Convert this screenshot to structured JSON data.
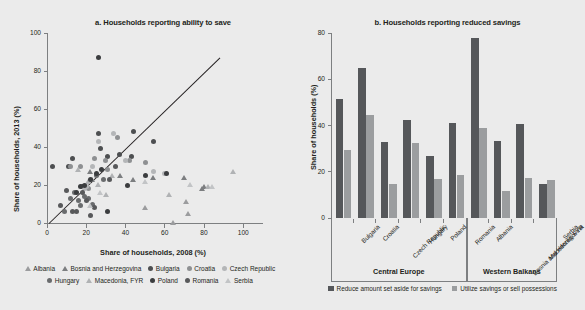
{
  "figure": {
    "background": "#ebebeb"
  },
  "panel_a": {
    "title": "a. Households reporting ability to save",
    "ylabel": "Share of households, 2013 (%)",
    "xlabel": "Share of households, 2008 (%)",
    "yticks": [
      "0",
      "20",
      "40",
      "60",
      "80",
      "100"
    ],
    "xticks": [
      "0",
      "20",
      "40",
      "60",
      "80",
      "100"
    ],
    "legend": [
      {
        "label": "Albania",
        "marker": "triangle",
        "color": "#9b9c9e"
      },
      {
        "label": "Bosnia and Herzegovina",
        "marker": "triangle",
        "color": "#7c7e80"
      },
      {
        "label": "Bulgaria",
        "marker": "circle",
        "color": "#4d4f51"
      },
      {
        "label": "Croatia",
        "marker": "circle",
        "color": "#8e9092"
      },
      {
        "label": "Czech Republic",
        "marker": "circle",
        "color": "#b4b6b8"
      },
      {
        "label": "Hungary",
        "marker": "circle",
        "color": "#6a6c6e"
      },
      {
        "label": "Macedonia, FYR",
        "marker": "triangle",
        "color": "#b0b2b4"
      },
      {
        "label": "Poland",
        "marker": "circle",
        "color": "#3b3d3f"
      },
      {
        "label": "Romania",
        "marker": "circle",
        "color": "#58595b"
      },
      {
        "label": "Serbia",
        "marker": "triangle",
        "color": "#c2c4c6"
      }
    ]
  },
  "panel_b": {
    "title": "b. Households reporting reduced savings",
    "ylabel": "Share of households (%)",
    "yticks": [
      "0",
      "20",
      "40",
      "60",
      "80"
    ],
    "groups": [
      {
        "label": "Central Europe",
        "span": 6
      },
      {
        "label": "Western Balkans",
        "span": 4
      }
    ],
    "legend": [
      {
        "label": "Reduce amount set aside for savings",
        "color": "#55575a"
      },
      {
        "label": "Utilize savings or sell possessions",
        "color": "#9b9d9f"
      }
    ]
  },
  "chart_data": [
    {
      "type": "scatter",
      "title": "a. Households reporting ability to save",
      "xlabel": "Share of households, 2008 (%)",
      "ylabel": "Share of households, 2013 (%)",
      "xlim": [
        0,
        108
      ],
      "ylim": [
        0,
        100
      ],
      "xticks": [
        0,
        20,
        40,
        60,
        80,
        100
      ],
      "yticks": [
        0,
        20,
        40,
        60,
        80,
        100
      ],
      "grid": false,
      "legend_position": "bottom",
      "reference_line": {
        "type": "45-degree",
        "from": [
          1,
          0
        ],
        "to": [
          88,
          87
        ]
      },
      "series": [
        {
          "name": "Albania",
          "marker": "triangle",
          "color": "#9b9c9e",
          "points": [
            [
              50,
              8
            ],
            [
              64,
              0
            ],
            [
              72,
              5
            ],
            [
              71,
              11
            ]
          ]
        },
        {
          "name": "Bosnia and Herzegovina",
          "marker": "triangle",
          "color": "#7c7e80",
          "points": [
            [
              22,
              27
            ],
            [
              23,
              23
            ],
            [
              37,
              25
            ],
            [
              44,
              23
            ],
            [
              54,
              24
            ],
            [
              70,
              24
            ],
            [
              79,
              18
            ],
            [
              80,
              19
            ]
          ]
        },
        {
          "name": "Bulgaria",
          "marker": "circle",
          "color": "#4d4f51",
          "points": [
            [
              3,
              30
            ],
            [
              11,
              30
            ],
            [
              13,
              34
            ],
            [
              18,
              19
            ],
            [
              26,
              47
            ],
            [
              27,
              39
            ],
            [
              31,
              35
            ],
            [
              37,
              36
            ],
            [
              43,
              35
            ],
            [
              54,
              43
            ],
            [
              44,
              48
            ]
          ]
        },
        {
          "name": "Croatia",
          "marker": "circle",
          "color": "#8e9092",
          "points": [
            [
              12,
              30
            ],
            [
              17,
              30
            ],
            [
              21,
              18
            ],
            [
              24,
              34
            ],
            [
              30,
              33
            ],
            [
              36,
              45
            ],
            [
              42,
              33
            ],
            [
              50,
              32
            ],
            [
              31,
              28
            ]
          ]
        },
        {
          "name": "Czech Republic",
          "marker": "circle",
          "color": "#b4b6b8",
          "points": [
            [
              19,
              18
            ],
            [
              20,
              19
            ],
            [
              23,
              30
            ],
            [
              26,
              43
            ],
            [
              34,
              47
            ],
            [
              40,
              33
            ],
            [
              54,
              27
            ],
            [
              60,
              26
            ]
          ]
        },
        {
          "name": "Hungary",
          "marker": "circle",
          "color": "#6a6c6e",
          "points": [
            [
              9,
              6
            ],
            [
              12,
              13
            ],
            [
              14,
              16
            ],
            [
              16,
              12
            ],
            [
              17,
              9
            ],
            [
              19,
              14
            ],
            [
              21,
              13
            ],
            [
              23,
              10
            ],
            [
              25,
              25
            ],
            [
              29,
              23
            ]
          ]
        },
        {
          "name": "Macedonia, FYR",
          "marker": "triangle",
          "color": "#b0b2b4",
          "points": [
            [
              16,
              28
            ],
            [
              21,
              22
            ],
            [
              26,
              20
            ],
            [
              30,
              15
            ],
            [
              33,
              25
            ],
            [
              62,
              15
            ],
            [
              82,
              19
            ],
            [
              95,
              27
            ]
          ]
        },
        {
          "name": "Poland",
          "marker": "circle",
          "color": "#3b3d3f",
          "points": [
            [
              15,
              16
            ],
            [
              17,
              19
            ],
            [
              19,
              20
            ],
            [
              22,
              23
            ],
            [
              25,
              26
            ],
            [
              28,
              28
            ],
            [
              31,
              6
            ],
            [
              41,
              20
            ],
            [
              50,
              25
            ],
            [
              61,
              26
            ],
            [
              26,
              87
            ]
          ]
        },
        {
          "name": "Romania",
          "marker": "circle",
          "color": "#58595b",
          "points": [
            [
              7,
              9
            ],
            [
              10,
              17
            ],
            [
              13,
              6
            ],
            [
              15,
              6
            ],
            [
              18,
              16
            ],
            [
              20,
              12
            ],
            [
              22,
              4
            ],
            [
              24,
              8
            ],
            [
              32,
              23
            ],
            [
              35,
              30
            ]
          ]
        },
        {
          "name": "Serbia",
          "marker": "triangle",
          "color": "#c2c4c6",
          "points": [
            [
              22,
              9
            ],
            [
              27,
              16
            ],
            [
              50,
              22
            ],
            [
              73,
              20
            ],
            [
              84,
              19
            ]
          ]
        }
      ]
    },
    {
      "type": "bar",
      "title": "b. Households reporting reduced savings",
      "xlabel": "",
      "ylabel": "Share of households (%)",
      "ylim": [
        0,
        80
      ],
      "yticks": [
        0,
        20,
        40,
        60,
        80
      ],
      "grid": false,
      "legend_position": "bottom",
      "categories": [
        "Bulgaria",
        "Croatia",
        "Czech Republic",
        "Hungary",
        "Poland",
        "Romania",
        "Albania",
        "Bosnia and Herzegovina",
        "Macedonia, FYR",
        "Serbia"
      ],
      "groups": [
        {
          "label": "Central Europe",
          "categories": [
            "Bulgaria",
            "Croatia",
            "Czech Republic",
            "Hungary",
            "Poland",
            "Romania"
          ]
        },
        {
          "label": "Western Balkans",
          "categories": [
            "Albania",
            "Bosnia and Herzegovina",
            "Macedonia, FYR",
            "Serbia"
          ]
        }
      ],
      "series": [
        {
          "name": "Reduce amount set aside for savings",
          "color": "#55575a",
          "values": [
            51.5,
            65,
            33,
            42.5,
            27,
            41,
            78,
            33.5,
            40.5,
            14.5
          ]
        },
        {
          "name": "Utilize savings or sell possessions",
          "color": "#9b9d9f",
          "values": [
            29.5,
            44.5,
            14.5,
            32.5,
            17,
            18.5,
            39,
            11.5,
            17.5,
            16.5
          ]
        }
      ]
    }
  ]
}
